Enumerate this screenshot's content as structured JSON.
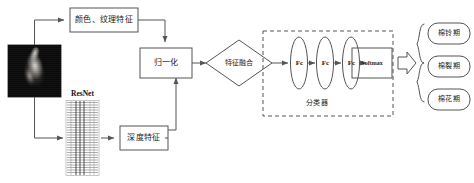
{
  "diagram": {
    "nodes": {
      "input_image": "cotton-boll-photo",
      "color_texture": "颜色、纹理特征",
      "resnet_label": "ResNet",
      "deep_feature": "深度特征",
      "normalize": "归一化",
      "fusion": "特征融合",
      "fc1": "Fc",
      "fc2": "Fc",
      "fc3": "Fc",
      "softmax": "Softmax",
      "classifier": "分类器"
    },
    "outputs": [
      "棉铃期",
      "棉裂期",
      "棉花期"
    ],
    "colors": {
      "stroke": "#555555",
      "text": "#1a1a1a",
      "background": "#ffffff",
      "dashed_border": "#555555"
    }
  }
}
